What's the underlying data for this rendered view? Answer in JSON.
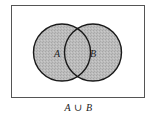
{
  "diagram": {
    "type": "venn",
    "universe": {
      "x": 11,
      "y": 5,
      "width": 134,
      "height": 93,
      "stroke": "#555555"
    },
    "sets": [
      {
        "name": "A",
        "label": "A",
        "cx": 62,
        "cy": 52.5,
        "r": 28.5
      },
      {
        "name": "B",
        "label": "B",
        "cx": 93,
        "cy": 52.5,
        "r": 28.5
      }
    ],
    "shaded_region": "A ∪ B",
    "fill_color": "#b9b9b9",
    "stroke_color": "#1a1a1a",
    "caption": {
      "left": "A",
      "operator": "∪",
      "right": "B"
    }
  }
}
